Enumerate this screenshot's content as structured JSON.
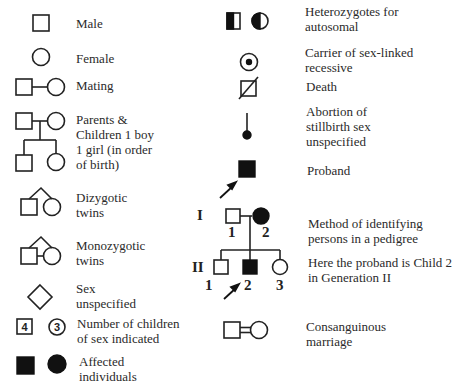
{
  "legend_left": [
    {
      "id": "male",
      "label": [
        "Male"
      ]
    },
    {
      "id": "female",
      "label": [
        "Female"
      ]
    },
    {
      "id": "mating",
      "label": [
        "Mating"
      ]
    },
    {
      "id": "parents-children",
      "label": [
        "Parents &",
        "Children 1 boy",
        "1 girl (in order",
        "of birth)"
      ]
    },
    {
      "id": "dizygotic-twins",
      "label": [
        "Dizygotic",
        "twins"
      ]
    },
    {
      "id": "monozygotic-twins",
      "label": [
        "Monozygotic",
        "twins"
      ]
    },
    {
      "id": "sex-unspecified",
      "label": [
        "Sex",
        "unspecified"
      ]
    },
    {
      "id": "number-of-children",
      "label": [
        "Number of children",
        "of sex indicated"
      ],
      "numbers": {
        "male": "4",
        "female": "3"
      }
    },
    {
      "id": "affected",
      "label": [
        "Affected",
        "individuals"
      ]
    }
  ],
  "legend_right": [
    {
      "id": "heterozygotes",
      "label": [
        "Heterozygotes for",
        "autosomal"
      ]
    },
    {
      "id": "carrier",
      "label": [
        "Carrier of sex-linked",
        "recessive"
      ]
    },
    {
      "id": "death",
      "label": [
        "Death"
      ]
    },
    {
      "id": "abortion",
      "label": [
        "Abortion of",
        "stillbirth sex",
        "unspecified"
      ]
    },
    {
      "id": "proband",
      "label": [
        "Proband"
      ]
    },
    {
      "id": "method",
      "label": [
        "Method of identifying",
        "persons in a pedigree"
      ]
    },
    {
      "id": "proband-example",
      "label": [
        "Here the proband is Child 2",
        "in Generation II"
      ]
    },
    {
      "id": "consanguineous",
      "label": [
        "Consanguinous",
        "marriage"
      ]
    }
  ],
  "pedigree": {
    "generations": [
      "I",
      "II"
    ],
    "gen1_numbers": [
      "1",
      "2"
    ],
    "gen2_numbers": [
      "1",
      "2",
      "3"
    ]
  },
  "colors": {
    "stroke": "#222222",
    "fill_affected": "#111111",
    "background": "#ffffff"
  }
}
